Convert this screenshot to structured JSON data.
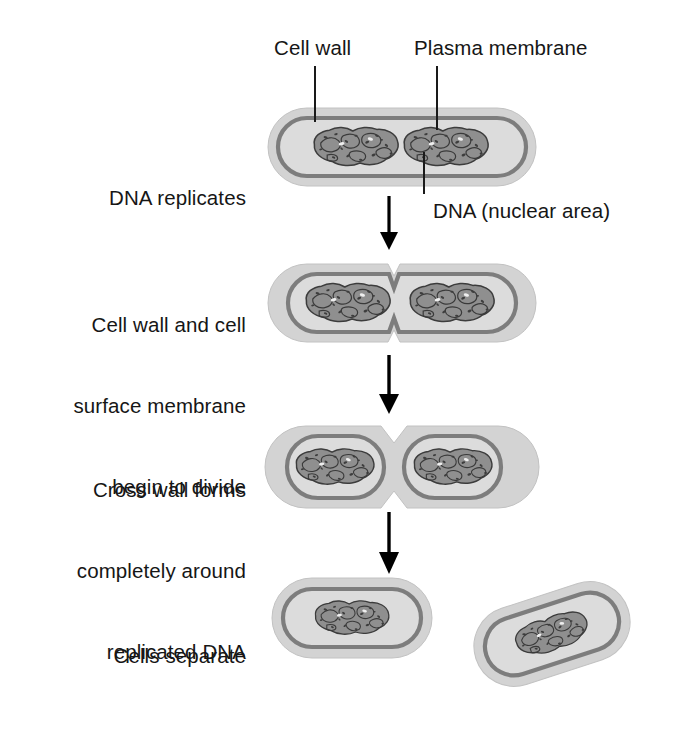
{
  "figure": {
    "background_color": "#ffffff"
  },
  "colors": {
    "cell_wall": "#d3d3d3",
    "cell_wall_edge": "#bdbdbd",
    "cytoplasm": "#dcdcdc",
    "plasma_membrane": "#7d7d7d",
    "nucleoid_fill": "#8f8f8f",
    "nucleoid_stroke": "#3c3c3c",
    "arrow": "#000000",
    "leader_line": "#1a1a1a",
    "text": "#161616"
  },
  "callouts": [
    {
      "id": "cell-wall",
      "label": "Cell wall",
      "x": 274,
      "y": 34,
      "leader": {
        "x": 315,
        "y1": 66,
        "y2": 122
      }
    },
    {
      "id": "plasma-membrane",
      "label": "Plasma membrane",
      "x": 414,
      "y": 34,
      "leader": {
        "x": 437,
        "y1": 66,
        "y2": 129
      }
    },
    {
      "id": "dna-nuclear-area",
      "label": "DNA (nuclear area)",
      "x": 433,
      "y": 197,
      "leader": {
        "x": 424,
        "y1": 152,
        "y2": 194
      }
    }
  ],
  "stages": [
    {
      "id": "stage-1",
      "lines": [
        "DNA replicates"
      ],
      "label_top": 130,
      "cell": {
        "cx": 402,
        "cy": 147,
        "w": 268,
        "h": 78,
        "type": "single-two-nucleoids"
      }
    },
    {
      "id": "stage-2",
      "lines": [
        "Cell wall and cell",
        "surface membrane",
        "begin to divide"
      ],
      "label_top": 257,
      "cell": {
        "cx": 402,
        "cy": 303,
        "w": 268,
        "h": 78,
        "type": "shallow-pinch"
      }
    },
    {
      "id": "stage-3",
      "lines": [
        "Cross wall forms",
        "completely around",
        "replicated DNA"
      ],
      "label_top": 422,
      "cell": {
        "cx": 402,
        "cy": 467,
        "w": 272,
        "h": 82,
        "type": "cross-wall"
      }
    },
    {
      "id": "stage-4",
      "lines": [
        "Cells separate"
      ],
      "label_top": 588,
      "cell": {
        "cx": 352,
        "cy": 618,
        "w": 160,
        "h": 80,
        "type": "separated-pair"
      }
    }
  ],
  "arrows": [
    {
      "id": "arrow-1",
      "x": 389,
      "y1": 196,
      "y2": 248
    },
    {
      "id": "arrow-2",
      "x": 389,
      "y1": 355,
      "y2": 412
    },
    {
      "id": "arrow-3",
      "x": 389,
      "y1": 512,
      "y2": 572
    }
  ]
}
